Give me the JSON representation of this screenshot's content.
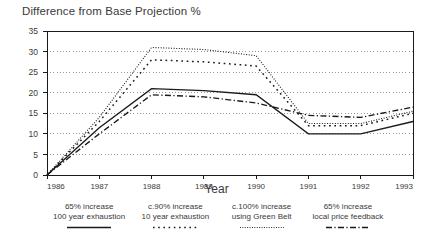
{
  "chart_data": {
    "type": "line",
    "title": "Difference from Base Projection %",
    "xlabel": "Year",
    "ylabel": "",
    "categories": [
      "1986",
      "1987",
      "1988",
      "1989",
      "1990",
      "1991",
      "1992",
      "1993"
    ],
    "x": [
      1986,
      1987,
      1988,
      1989,
      1990,
      1991,
      1992,
      1993
    ],
    "xlim": [
      1986,
      1993
    ],
    "ylim": [
      0,
      35
    ],
    "yticks": [
      0,
      5,
      10,
      15,
      20,
      25,
      30,
      35
    ],
    "ytick_labels": [
      "0",
      "5",
      "10",
      "15",
      "20",
      "25",
      "30",
      "35"
    ],
    "grid": "horizontal-dotted",
    "legend_position": "below",
    "series": [
      {
        "name": "65% increase 100 year exhaustion",
        "label_line1": "65% increase",
        "label_line2": "100 year exhaustion",
        "style": "solid",
        "color": "#1a1a1a",
        "values": [
          0,
          11.5,
          21,
          20.5,
          19.5,
          10,
          10,
          13
        ]
      },
      {
        "name": "c.90% increase 10 year exhaustion",
        "label_line1": "c.90% increase",
        "label_line2": "10 year exhaustion",
        "style": "dotted-sparse",
        "color": "#1a1a1a",
        "values": [
          0,
          13,
          28,
          27.5,
          26.5,
          12,
          12,
          15
        ]
      },
      {
        "name": "c.100% increase using Green Belt",
        "label_line1": "c.100% increase",
        "label_line2": "using Green Belt",
        "style": "dotted-fine",
        "color": "#1a1a1a",
        "values": [
          0,
          14,
          31,
          30.5,
          29,
          12.5,
          12.5,
          15.5
        ]
      },
      {
        "name": "65% increase local price feedback",
        "label_line1": "65% increase",
        "label_line2": "local price feedback",
        "style": "dash-dot",
        "color": "#1a1a1a",
        "values": [
          0,
          10,
          19.5,
          19,
          17.5,
          14.5,
          14,
          16.5
        ]
      }
    ]
  },
  "axis": {
    "x_label": "Year",
    "y_tick_0": "0",
    "y_tick_1": "5",
    "y_tick_2": "10",
    "y_tick_3": "15",
    "y_tick_4": "20",
    "y_tick_5": "25",
    "y_tick_6": "30",
    "y_tick_7": "35",
    "x_tick_0": "1986",
    "x_tick_1": "1987",
    "x_tick_2": "1988",
    "x_tick_3": "1989",
    "x_tick_4": "1990",
    "x_tick_5": "1991",
    "x_tick_6": "1992",
    "x_tick_7": "1993"
  },
  "legend": {
    "items": [
      {
        "line1": "65% increase",
        "line2": "100 year exhaustion"
      },
      {
        "line1": "c.90% increase",
        "line2": "10 year exhaustion"
      },
      {
        "line1": "c.100% increase",
        "line2": "using Green Belt"
      },
      {
        "line1": "65% increase",
        "line2": "local price feedback"
      }
    ]
  },
  "colors": {
    "ink": "#1a1a1a",
    "text": "#3a3a3a",
    "grid": "#8c8c8c",
    "frame": "#1a1a1a",
    "background": "#ffffff"
  }
}
